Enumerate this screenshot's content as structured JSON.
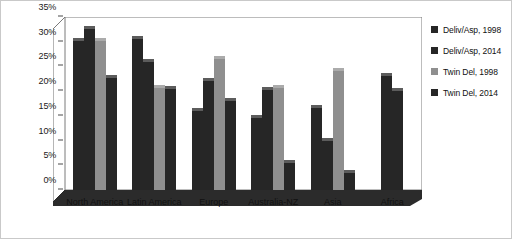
{
  "chart_data": {
    "type": "bar",
    "title": "",
    "subtitle": "",
    "xlabel": "",
    "ylabel": "",
    "ylim": [
      0,
      35
    ],
    "ytick_labels": [
      "0%",
      "5%",
      "10%",
      "15%",
      "20%",
      "25%",
      "30%",
      "35%"
    ],
    "ytick_values": [
      0,
      5,
      10,
      15,
      20,
      25,
      30,
      35
    ],
    "grid": false,
    "legend_position": "right",
    "categories": [
      "North America",
      "Latin America",
      "Europe",
      "Australia-NZ",
      "Asia",
      "Africa"
    ],
    "series": [
      {
        "name": "Deliv/Asp, 1998",
        "color": "#262626",
        "values": [
          30.2,
          30.5,
          16.0,
          14.5,
          16.5,
          23.0
        ]
      },
      {
        "name": "Deliv/Asp, 2014",
        "color": "#262626",
        "values": [
          32.5,
          26.0,
          22.0,
          20.3,
          10.0,
          20.0
        ]
      },
      {
        "name": "Twin Del, 1998",
        "color": "#8f8f8f",
        "values": [
          30.2,
          20.7,
          26.5,
          20.7,
          24.0,
          null
        ]
      },
      {
        "name": "Twin Del, 2014",
        "color": "#262626",
        "values": [
          22.6,
          20.4,
          18.0,
          5.5,
          3.5,
          null
        ]
      }
    ]
  },
  "legend": {
    "items": [
      {
        "label": "Deliv/Asp, 1998",
        "swatch": "#262626"
      },
      {
        "label": "Deliv/Asp, 2014",
        "swatch": "#262626"
      },
      {
        "label": "Twin Del, 1998",
        "swatch": "#8f8f8f"
      },
      {
        "label": "Twin Del, 2014",
        "swatch": "#262626"
      }
    ]
  },
  "colors": {
    "dark_bar": "#262626",
    "light_bar": "#8f8f8f",
    "axis": "#4a4a4a",
    "text": "#111111",
    "frame": "#6e6e6e",
    "outer_border": "#c9c9c9"
  }
}
